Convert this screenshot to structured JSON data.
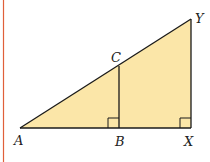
{
  "diagram": {
    "type": "similar right triangles",
    "fill_color": "#fbe6a8",
    "stroke_color": "#1a1a1a",
    "margin_line_color": "#e0603a",
    "points": {
      "A": {
        "label": "A",
        "x": 20,
        "y": 128
      },
      "B": {
        "label": "B",
        "x": 119,
        "y": 128
      },
      "C": {
        "label": "C",
        "x": 119,
        "y": 66
      },
      "X": {
        "label": "X",
        "x": 191,
        "y": 128
      },
      "Y": {
        "label": "Y",
        "x": 191,
        "y": 19
      }
    },
    "right_angles": [
      "B",
      "X"
    ]
  }
}
